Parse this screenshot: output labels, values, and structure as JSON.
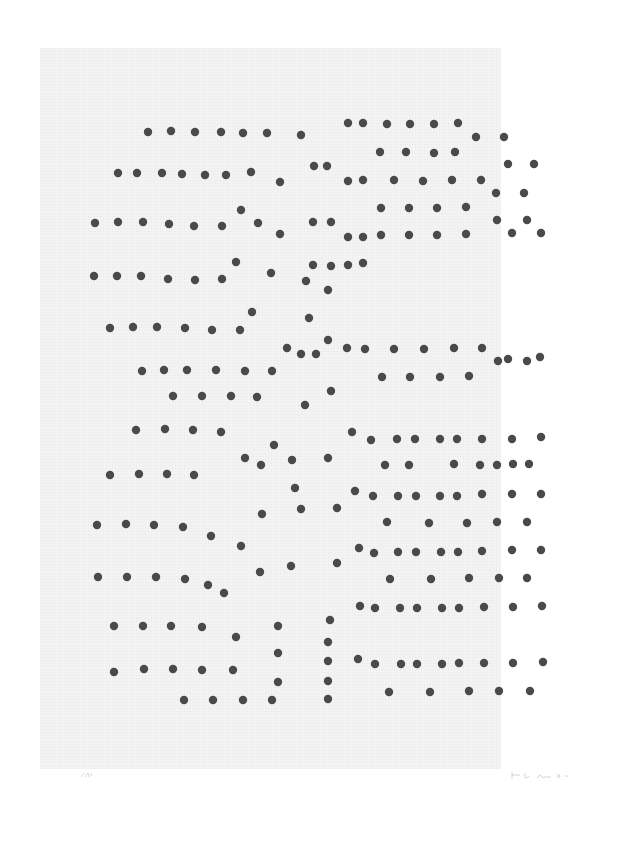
{
  "artwork": {
    "medium": "print",
    "paper_color": "#f4f4f4",
    "dot_color": "#4a4a4a",
    "dot_radius": 4.2
  },
  "dots": [
    [
      148,
      132
    ],
    [
      171,
      131
    ],
    [
      195,
      132
    ],
    [
      221,
      132
    ],
    [
      243,
      133
    ],
    [
      267,
      133
    ],
    [
      301,
      135
    ],
    [
      348,
      123
    ],
    [
      363,
      123
    ],
    [
      387,
      124
    ],
    [
      410,
      124
    ],
    [
      434,
      124
    ],
    [
      458,
      123
    ],
    [
      476,
      137
    ],
    [
      504,
      137
    ],
    [
      118,
      173
    ],
    [
      137,
      173
    ],
    [
      162,
      173
    ],
    [
      182,
      174
    ],
    [
      205,
      175
    ],
    [
      226,
      175
    ],
    [
      251,
      172
    ],
    [
      280,
      182
    ],
    [
      314,
      166
    ],
    [
      327,
      166
    ],
    [
      380,
      152
    ],
    [
      406,
      152
    ],
    [
      434,
      153
    ],
    [
      455,
      152
    ],
    [
      508,
      164
    ],
    [
      534,
      164
    ],
    [
      95,
      223
    ],
    [
      118,
      222
    ],
    [
      143,
      222
    ],
    [
      169,
      224
    ],
    [
      194,
      226
    ],
    [
      222,
      226
    ],
    [
      241,
      210
    ],
    [
      258,
      223
    ],
    [
      280,
      234
    ],
    [
      313,
      222
    ],
    [
      331,
      222
    ],
    [
      348,
      181
    ],
    [
      363,
      180
    ],
    [
      394,
      180
    ],
    [
      423,
      181
    ],
    [
      452,
      180
    ],
    [
      481,
      180
    ],
    [
      496,
      193
    ],
    [
      524,
      193
    ],
    [
      94,
      276
    ],
    [
      117,
      276
    ],
    [
      141,
      276
    ],
    [
      168,
      279
    ],
    [
      195,
      280
    ],
    [
      222,
      279
    ],
    [
      236,
      262
    ],
    [
      271,
      273
    ],
    [
      306,
      281
    ],
    [
      313,
      265
    ],
    [
      331,
      266
    ],
    [
      348,
      237
    ],
    [
      363,
      237
    ],
    [
      381,
      208
    ],
    [
      409,
      208
    ],
    [
      437,
      208
    ],
    [
      466,
      207
    ],
    [
      497,
      220
    ],
    [
      527,
      220
    ],
    [
      110,
      328
    ],
    [
      133,
      327
    ],
    [
      157,
      327
    ],
    [
      185,
      328
    ],
    [
      212,
      330
    ],
    [
      240,
      330
    ],
    [
      252,
      312
    ],
    [
      287,
      348
    ],
    [
      316,
      354
    ],
    [
      328,
      290
    ],
    [
      348,
      265
    ],
    [
      363,
      263
    ],
    [
      381,
      235
    ],
    [
      409,
      235
    ],
    [
      437,
      235
    ],
    [
      466,
      234
    ],
    [
      512,
      233
    ],
    [
      541,
      233
    ],
    [
      142,
      371
    ],
    [
      164,
      370
    ],
    [
      187,
      370
    ],
    [
      216,
      370
    ],
    [
      245,
      371
    ],
    [
      272,
      371
    ],
    [
      301,
      354
    ],
    [
      309,
      318
    ],
    [
      328,
      340
    ],
    [
      347,
      348
    ],
    [
      365,
      349
    ],
    [
      394,
      349
    ],
    [
      424,
      349
    ],
    [
      454,
      348
    ],
    [
      482,
      348
    ],
    [
      498,
      361
    ],
    [
      527,
      361
    ],
    [
      173,
      396
    ],
    [
      202,
      396
    ],
    [
      231,
      396
    ],
    [
      257,
      397
    ],
    [
      305,
      405
    ],
    [
      331,
      391
    ],
    [
      382,
      377
    ],
    [
      410,
      377
    ],
    [
      440,
      377
    ],
    [
      469,
      376
    ],
    [
      508,
      359
    ],
    [
      540,
      357
    ],
    [
      136,
      430
    ],
    [
      165,
      429
    ],
    [
      193,
      430
    ],
    [
      221,
      432
    ],
    [
      274,
      445
    ],
    [
      292,
      460
    ],
    [
      328,
      458
    ],
    [
      352,
      432
    ],
    [
      371,
      440
    ],
    [
      397,
      439
    ],
    [
      415,
      439
    ],
    [
      440,
      439
    ],
    [
      457,
      439
    ],
    [
      482,
      439
    ],
    [
      512,
      439
    ],
    [
      541,
      437
    ],
    [
      110,
      475
    ],
    [
      139,
      474
    ],
    [
      167,
      474
    ],
    [
      194,
      475
    ],
    [
      245,
      458
    ],
    [
      261,
      465
    ],
    [
      295,
      488
    ],
    [
      385,
      465
    ],
    [
      409,
      465
    ],
    [
      454,
      464
    ],
    [
      480,
      465
    ],
    [
      497,
      465
    ],
    [
      513,
      464
    ],
    [
      529,
      464
    ],
    [
      97,
      525
    ],
    [
      126,
      524
    ],
    [
      154,
      525
    ],
    [
      183,
      527
    ],
    [
      211,
      536
    ],
    [
      241,
      546
    ],
    [
      262,
      514
    ],
    [
      301,
      509
    ],
    [
      337,
      508
    ],
    [
      355,
      491
    ],
    [
      373,
      496
    ],
    [
      398,
      496
    ],
    [
      416,
      496
    ],
    [
      440,
      496
    ],
    [
      457,
      496
    ],
    [
      482,
      494
    ],
    [
      512,
      494
    ],
    [
      541,
      494
    ],
    [
      98,
      577
    ],
    [
      127,
      577
    ],
    [
      156,
      577
    ],
    [
      185,
      579
    ],
    [
      208,
      585
    ],
    [
      224,
      593
    ],
    [
      260,
      572
    ],
    [
      291,
      566
    ],
    [
      337,
      563
    ],
    [
      359,
      548
    ],
    [
      374,
      553
    ],
    [
      398,
      552
    ],
    [
      416,
      552
    ],
    [
      441,
      552
    ],
    [
      458,
      552
    ],
    [
      482,
      551
    ],
    [
      512,
      550
    ],
    [
      541,
      550
    ],
    [
      114,
      626
    ],
    [
      143,
      626
    ],
    [
      171,
      626
    ],
    [
      202,
      627
    ],
    [
      236,
      637
    ],
    [
      278,
      626
    ],
    [
      330,
      620
    ],
    [
      387,
      522
    ],
    [
      429,
      523
    ],
    [
      467,
      523
    ],
    [
      497,
      522
    ],
    [
      527,
      522
    ],
    [
      114,
      672
    ],
    [
      144,
      669
    ],
    [
      173,
      669
    ],
    [
      202,
      670
    ],
    [
      233,
      670
    ],
    [
      278,
      653
    ],
    [
      328,
      642
    ],
    [
      360,
      606
    ],
    [
      375,
      608
    ],
    [
      400,
      608
    ],
    [
      417,
      608
    ],
    [
      442,
      608
    ],
    [
      459,
      608
    ],
    [
      484,
      607
    ],
    [
      513,
      607
    ],
    [
      542,
      606
    ],
    [
      184,
      700
    ],
    [
      213,
      700
    ],
    [
      243,
      700
    ],
    [
      272,
      700
    ],
    [
      278,
      682
    ],
    [
      328,
      661
    ],
    [
      328,
      681
    ],
    [
      328,
      699
    ],
    [
      358,
      659
    ],
    [
      375,
      664
    ],
    [
      401,
      664
    ],
    [
      417,
      664
    ],
    [
      442,
      664
    ],
    [
      459,
      663
    ],
    [
      484,
      663
    ],
    [
      513,
      663
    ],
    [
      543,
      662
    ],
    [
      390,
      579
    ],
    [
      431,
      579
    ],
    [
      469,
      578
    ],
    [
      499,
      578
    ],
    [
      527,
      578
    ],
    [
      389,
      692
    ],
    [
      430,
      692
    ],
    [
      469,
      691
    ],
    [
      499,
      691
    ],
    [
      530,
      691
    ]
  ]
}
